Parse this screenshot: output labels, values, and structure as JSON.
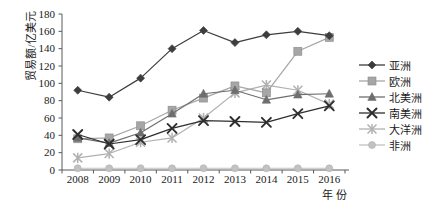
{
  "chart_data": {
    "type": "line",
    "title": "",
    "xlabel": "年 份",
    "ylabel": "贸易额/亿美元",
    "categories": [
      "2008",
      "2009",
      "2010",
      "2011",
      "2012",
      "2013",
      "2014",
      "2015",
      "2016"
    ],
    "ylim": [
      0,
      180
    ],
    "yticks": [
      0,
      20,
      40,
      60,
      80,
      100,
      120,
      140,
      160,
      180
    ],
    "grid": false,
    "legend_position": "right",
    "series": [
      {
        "name": "亚洲",
        "marker": "diamond",
        "color": "#3d3d3d",
        "values": [
          92,
          84,
          106,
          140,
          161,
          147,
          156,
          160,
          155
        ]
      },
      {
        "name": "欧洲",
        "marker": "square",
        "color": "#a6a6a6",
        "values": [
          36,
          37,
          51,
          69,
          83,
          97,
          89,
          137,
          153
        ]
      },
      {
        "name": "北美洲",
        "marker": "triangle",
        "color": "#6e6e6e",
        "values": [
          37,
          31,
          43,
          65,
          88,
          92,
          81,
          87,
          88
        ]
      },
      {
        "name": "南美洲",
        "marker": "cross",
        "color": "#2e2e2e",
        "values": [
          41,
          30,
          35,
          48,
          57,
          56,
          55,
          65,
          74
        ]
      },
      {
        "name": "大洋洲",
        "marker": "star",
        "color": "#b0b0b0",
        "values": [
          14,
          19,
          32,
          37,
          60,
          89,
          98,
          92,
          76
        ]
      },
      {
        "name": "非洲",
        "marker": "circle",
        "color": "#c2c2c2",
        "values": [
          2,
          2,
          2,
          2,
          2,
          2,
          2,
          2,
          2
        ]
      }
    ]
  },
  "legend": {
    "items": [
      {
        "label": "亚洲"
      },
      {
        "label": "欧洲"
      },
      {
        "label": "北美洲"
      },
      {
        "label": "南美洲"
      },
      {
        "label": "大洋洲"
      },
      {
        "label": "非洲"
      }
    ]
  },
  "axes": {
    "y_axis_title": "贸易额/亿美元",
    "x_axis_title": "年 份"
  }
}
